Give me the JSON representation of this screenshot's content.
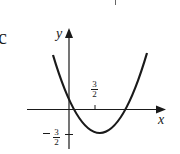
{
  "figure": {
    "part_label": "c",
    "axes": {
      "x_label": "x",
      "y_label": "y"
    },
    "ticks": {
      "x_tick": {
        "numerator": "3",
        "denominator": "2",
        "sign": ""
      },
      "y_tick": {
        "numerator": "3",
        "denominator": "2",
        "sign": "−"
      }
    },
    "curve": {
      "type": "parabola",
      "opens": "up",
      "vertex_x_label": "3/2",
      "vertex_y_label": "−3/2"
    },
    "colors": {
      "ink": "#1a1a1a",
      "background": "#ffffff"
    }
  }
}
